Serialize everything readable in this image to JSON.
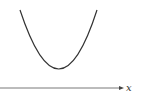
{
  "diagram": {
    "type": "function-plot",
    "curve": "parabola (upward-opening)",
    "axis_label": "x",
    "colors": {
      "curve": "#333333",
      "axis": "#555555",
      "background": "#ffffff"
    }
  }
}
